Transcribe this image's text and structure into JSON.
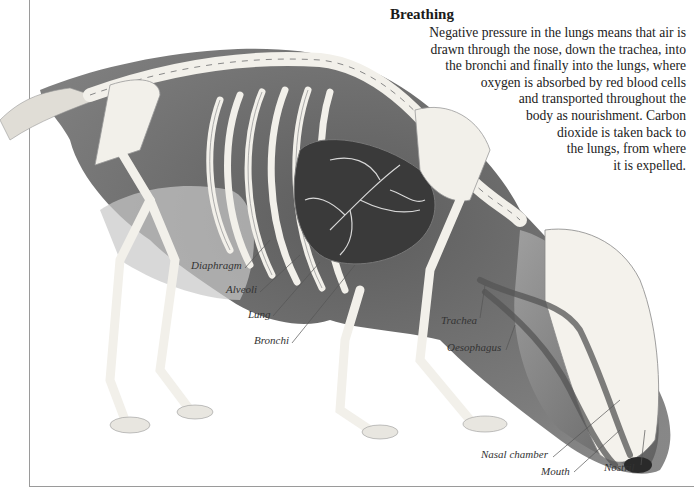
{
  "title": "Breathing",
  "body_lines": [
    "Negative pressure in the lungs means that air is",
    "drawn through the nose, down the trachea, into",
    "the bronchi and finally into the lungs, where",
    "oxygen is absorbed by red blood cells",
    "and transported throughout the",
    "body as nourishment. Carbon",
    "dioxide is taken back to",
    "the lungs, from where",
    "it is expelled."
  ],
  "labels": {
    "diaphragm": "Diaphragm",
    "alveoli": "Alveoli",
    "lung": "Lung",
    "bronchi": "Bronchi",
    "trachea": "Trachea",
    "oesophagus": "Oesophagus",
    "nasal_chamber": "Nasal chamber",
    "mouth": "Mouth",
    "nostril": "Nostril"
  },
  "colors": {
    "fur_dark": "#3a3a3a",
    "fur_mid": "#8a8a8a",
    "bone": "#f2f0ea",
    "frame": "#9a9a9a"
  }
}
